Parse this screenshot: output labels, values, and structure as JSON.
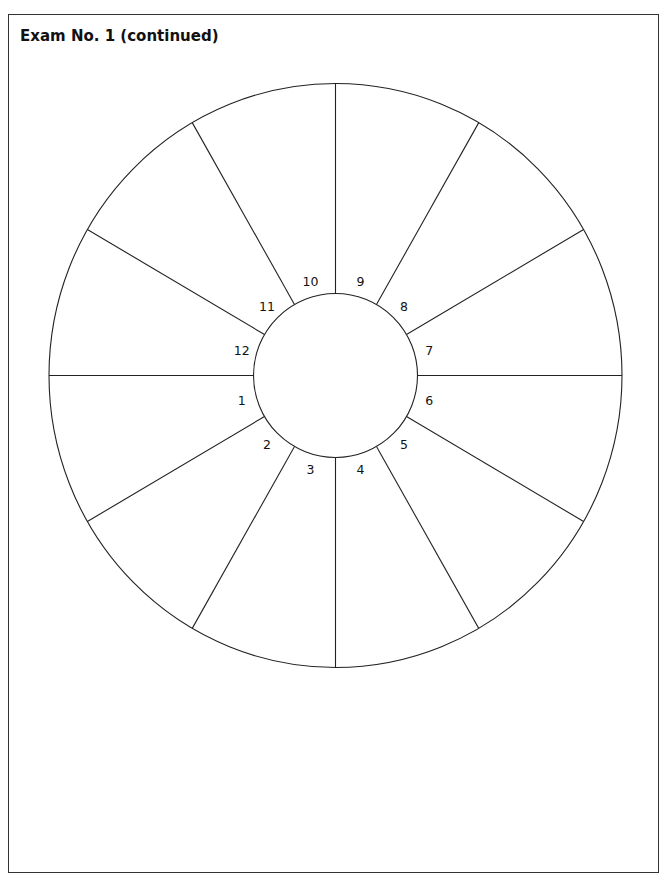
{
  "page": {
    "title": "Exam No. 1 (continued)"
  },
  "chart_wheel": {
    "type": "house-wheel",
    "segments": 12,
    "labels": [
      "1",
      "2",
      "3",
      "4",
      "5",
      "6",
      "7",
      "8",
      "9",
      "10",
      "11",
      "12"
    ],
    "colors": {
      "line": "#222222",
      "background": "#ffffff"
    }
  }
}
